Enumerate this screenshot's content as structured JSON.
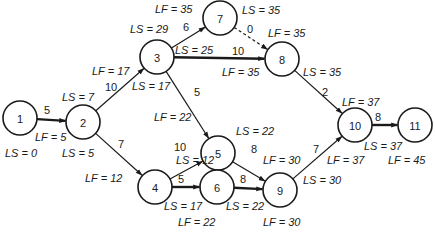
{
  "diagram": {
    "type": "activity-on-arrow network",
    "nodes": [
      {
        "id": "1",
        "x": 20,
        "y": 118
      },
      {
        "id": "2",
        "x": 83,
        "y": 122
      },
      {
        "id": "3",
        "x": 157,
        "y": 57
      },
      {
        "id": "4",
        "x": 155,
        "y": 187
      },
      {
        "id": "5",
        "x": 218,
        "y": 153
      },
      {
        "id": "6",
        "x": 217,
        "y": 187
      },
      {
        "id": "7",
        "x": 220,
        "y": 18
      },
      {
        "id": "8",
        "x": 282,
        "y": 59
      },
      {
        "id": "9",
        "x": 280,
        "y": 190
      },
      {
        "id": "10",
        "x": 355,
        "y": 125
      },
      {
        "id": "11",
        "x": 415,
        "y": 125
      }
    ],
    "edges": [
      {
        "from": "1",
        "to": "2",
        "duration": "5",
        "style": "critical",
        "lx": 44,
        "ly": 114
      },
      {
        "from": "2",
        "to": "3",
        "duration": "10",
        "style": "normal",
        "lx": 105,
        "ly": 91
      },
      {
        "from": "2",
        "to": "4",
        "duration": "7",
        "style": "normal",
        "lx": 118,
        "ly": 148
      },
      {
        "from": "3",
        "to": "7",
        "duration": "6",
        "style": "normal",
        "lx": 183,
        "ly": 31
      },
      {
        "from": "3",
        "to": "8",
        "duration": "10",
        "style": "critical",
        "lx": 232,
        "ly": 55
      },
      {
        "from": "3",
        "to": "5",
        "duration": "5",
        "style": "normal",
        "lx": 194,
        "ly": 96
      },
      {
        "from": "7",
        "to": "8",
        "duration": "0",
        "style": "dashed",
        "lx": 247,
        "ly": 33
      },
      {
        "from": "8",
        "to": "10",
        "duration": "2",
        "style": "normal",
        "lx": 322,
        "ly": 96
      },
      {
        "from": "4",
        "to": "5",
        "duration": "10",
        "style": "normal",
        "lx": 174,
        "ly": 151
      },
      {
        "from": "4",
        "to": "6",
        "duration": "5",
        "style": "critical",
        "lx": 178,
        "ly": 183
      },
      {
        "from": "5",
        "to": "9",
        "duration": "8",
        "style": "normal",
        "lx": 251,
        "ly": 153
      },
      {
        "from": "6",
        "to": "9",
        "duration": "8",
        "style": "critical",
        "lx": 240,
        "ly": 183
      },
      {
        "from": "9",
        "to": "10",
        "duration": "7",
        "style": "normal",
        "lx": 313,
        "ly": 153
      },
      {
        "from": "10",
        "to": "11",
        "duration": "8",
        "style": "critical",
        "lx": 375,
        "ly": 121
      }
    ],
    "labels": [
      {
        "text": "LF = 35",
        "x": 155,
        "y": 13
      },
      {
        "text": "LS = 35",
        "x": 242,
        "y": 14
      },
      {
        "text": "LS = 29",
        "x": 130,
        "y": 33
      },
      {
        "text": "LF = 35",
        "x": 268,
        "y": 37
      },
      {
        "text": "LS = 25",
        "x": 175,
        "y": 54
      },
      {
        "text": "LF = 35",
        "x": 222,
        "y": 76
      },
      {
        "text": "LS = 35",
        "x": 303,
        "y": 76
      },
      {
        "text": "LF = 17",
        "x": 92,
        "y": 75
      },
      {
        "text": "LS = 17",
        "x": 132,
        "y": 90
      },
      {
        "text": "LS = 7",
        "x": 62,
        "y": 101
      },
      {
        "text": "LF = 22",
        "x": 154,
        "y": 121
      },
      {
        "text": "LS = 22",
        "x": 236,
        "y": 135
      },
      {
        "text": "LF = 37",
        "x": 342,
        "y": 106
      },
      {
        "text": "LF = 5",
        "x": 35,
        "y": 141
      },
      {
        "text": "LS = 0",
        "x": 5,
        "y": 157
      },
      {
        "text": "LS = 5",
        "x": 62,
        "y": 157
      },
      {
        "text": "LF = 12",
        "x": 85,
        "y": 182
      },
      {
        "text": "LS = 12",
        "x": 176,
        "y": 164
      },
      {
        "text": "LF = 30",
        "x": 263,
        "y": 164
      },
      {
        "text": "LF = 37",
        "x": 327,
        "y": 164
      },
      {
        "text": "LS = 37",
        "x": 364,
        "y": 150
      },
      {
        "text": "LF = 45",
        "x": 388,
        "y": 164
      },
      {
        "text": "LS = 30",
        "x": 303,
        "y": 184
      },
      {
        "text": "LS = 17",
        "x": 164,
        "y": 210
      },
      {
        "text": "LS = 22",
        "x": 226,
        "y": 210
      },
      {
        "text": "LF = 22",
        "x": 178,
        "y": 226
      },
      {
        "text": "LF = 30",
        "x": 263,
        "y": 226
      }
    ]
  }
}
